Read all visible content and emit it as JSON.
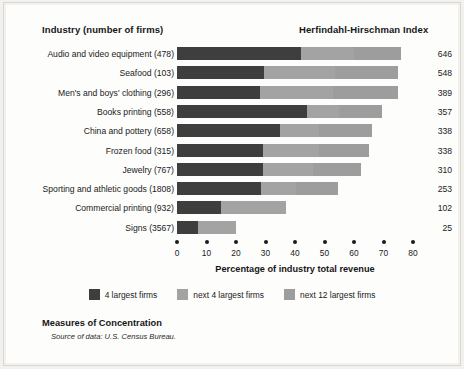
{
  "headers": {
    "industry": "Industry (number of firms)",
    "hhi": "Herfindahl-Hirschman Index"
  },
  "axis": {
    "title": "Percentage of industry total revenue",
    "ticks": [
      "0",
      "10",
      "20",
      "30",
      "40",
      "50",
      "60",
      "70",
      "80"
    ],
    "min": 0,
    "max": 80
  },
  "legend": [
    {
      "label": "4 largest firms",
      "color": "#3e3e3e",
      "swatch_name": "legend-swatch-4-largest"
    },
    {
      "label": "next 4 largest firms",
      "color": "#a3a3a3",
      "swatch_name": "legend-swatch-next-4"
    },
    {
      "label": "next 12 largest firms",
      "color": "#9d9d9d",
      "swatch_name": "legend-swatch-next-12"
    }
  ],
  "caption": {
    "title": "Measures of Concentration",
    "source": "Source of data: U.S. Census Bureau."
  },
  "colors": {
    "background": "#f2f1ee",
    "panel": "#fdfdfc",
    "text": "#1b1b1b",
    "seg1": "#3e3e3e",
    "seg2": "#a3a3a3",
    "seg3": "#9d9d9d"
  },
  "chart_data": {
    "type": "bar",
    "orientation": "horizontal",
    "stacked": true,
    "title": "Measures of Concentration",
    "xlabel": "Percentage of industry total revenue",
    "ylabel": "Industry (number of firms)",
    "xlim": [
      0,
      80
    ],
    "xticks": [
      0,
      10,
      20,
      30,
      40,
      50,
      60,
      70,
      80
    ],
    "grid": false,
    "legend_position": "bottom",
    "series": [
      {
        "name": "4 largest firms",
        "values": [
          42,
          29.5,
          28,
          44,
          35,
          29,
          29,
          28.5,
          15,
          7
        ]
      },
      {
        "name": "next 4 largest firms",
        "values": [
          18,
          24,
          25,
          11,
          13,
          19,
          17,
          12,
          22,
          13
        ]
      },
      {
        "name": "next 12 largest firms",
        "values": [
          16,
          21.5,
          22,
          14.5,
          18,
          17,
          16.5,
          14,
          0,
          0
        ]
      }
    ],
    "categories": [
      "Audio and video equipment (478)",
      "Seafood (103)",
      "Men's and boys' clothing (296)",
      "Books printing (558)",
      "China and pottery (658)",
      "Frozen food (315)",
      "Jewelry (767)",
      "Sporting and athletic goods (1808)",
      "Commercial printing (932)",
      "Signs (3567)"
    ],
    "rows": [
      {
        "label": "Audio and video equipment  (478)",
        "seg1": 42,
        "seg2": 18,
        "seg3": 16,
        "total": 76,
        "hhi": "646"
      },
      {
        "label": "Seafood  (103)",
        "seg1": 29.5,
        "seg2": 24,
        "seg3": 21.5,
        "total": 75,
        "hhi": "548"
      },
      {
        "label": "Men's and boys' clothing  (296)",
        "seg1": 28,
        "seg2": 25,
        "seg3": 22,
        "total": 75,
        "hhi": "389"
      },
      {
        "label": "Books printing  (558)",
        "seg1": 44,
        "seg2": 11,
        "seg3": 14.5,
        "total": 69.5,
        "hhi": "357"
      },
      {
        "label": "China and pottery  (658)",
        "seg1": 35,
        "seg2": 13,
        "seg3": 18,
        "total": 66,
        "hhi": "338"
      },
      {
        "label": "Frozen food  (315)",
        "seg1": 29,
        "seg2": 19,
        "seg3": 17,
        "total": 65,
        "hhi": "338"
      },
      {
        "label": "Jewelry  (767)",
        "seg1": 29,
        "seg2": 17,
        "seg3": 16.5,
        "total": 62.5,
        "hhi": "310"
      },
      {
        "label": "Sporting and athletic goods  (1808)",
        "seg1": 28.5,
        "seg2": 12,
        "seg3": 14,
        "total": 54.5,
        "hhi": "253"
      },
      {
        "label": "Commercial printing  (932)",
        "seg1": 15,
        "seg2": 22,
        "seg3": 0,
        "total": 37,
        "hhi": "102"
      },
      {
        "label": "Signs  (3567)",
        "seg1": 7,
        "seg2": 13,
        "seg3": 0,
        "total": 20,
        "hhi": "25"
      }
    ]
  }
}
